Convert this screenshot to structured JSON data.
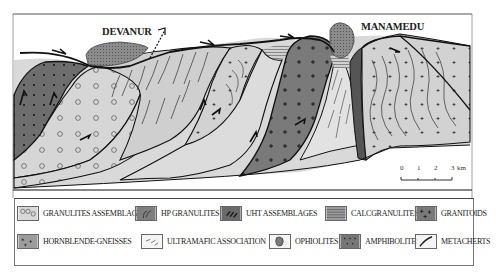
{
  "diagram": {
    "type": "geological-cross-section",
    "place_labels": [
      "DEVANUR",
      "MANAMEDU"
    ],
    "scale_bar": {
      "ticks": [
        "0",
        "1",
        "2",
        "3"
      ],
      "unit": "km"
    }
  },
  "legend": {
    "items": [
      {
        "label": "GRANULITES ASSEMBLAGE",
        "pattern": "circles-light"
      },
      {
        "label": "HP GRANULITES",
        "pattern": "curls-dark"
      },
      {
        "label": "UHT ASSEMBLAGES",
        "pattern": "dashes-dark"
      },
      {
        "label": "CALCGRANULITES",
        "pattern": "horizontal-lines"
      },
      {
        "label": "GRANITOIDS",
        "pattern": "crosses-dark"
      },
      {
        "label": "HORNBLENDE-GNEISSES",
        "pattern": "crosses-light"
      },
      {
        "label": "ULTRAMAFIC ASSOCIATION",
        "pattern": "dashes-white"
      },
      {
        "label": "OPHIOLITES",
        "pattern": "blob"
      },
      {
        "label": "AMPHIBOLITES",
        "pattern": "dots-dark"
      },
      {
        "label": "METACHERTS",
        "pattern": "curve-line"
      }
    ]
  },
  "colors": {
    "light_fill": "#d4d4d4",
    "medium_fill": "#a8a8a8",
    "dark_fill": "#6e6e6e",
    "outline": "#111111"
  }
}
